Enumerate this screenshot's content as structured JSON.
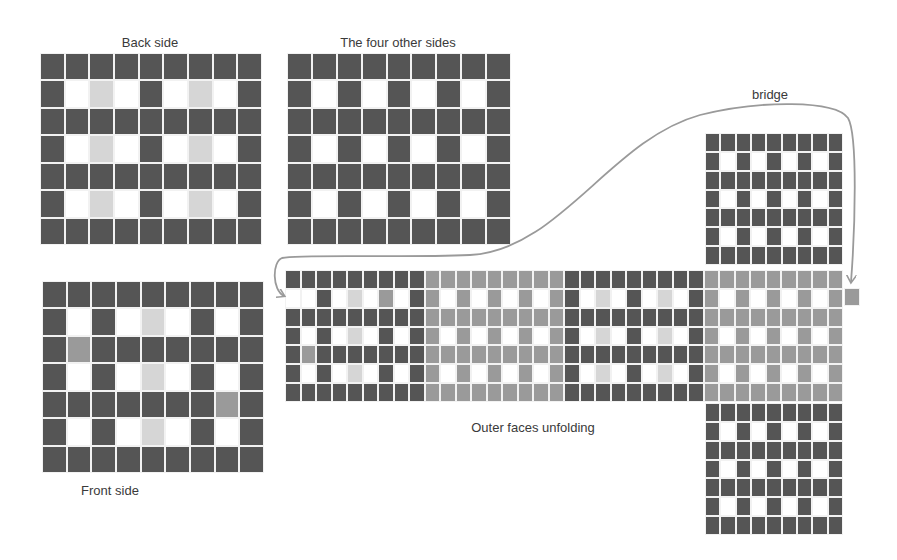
{
  "labels": {
    "back": "Back side",
    "four": "The four other sides",
    "front": "Front side",
    "unfold": "Outer faces unfolding",
    "bridge": "bridge"
  },
  "colors": {
    "dark": "#555555",
    "medium": "#9a9a9a",
    "light": "#d6d6d6",
    "white": "#ffffff",
    "arrow": "#9a9a9a"
  },
  "legend_codes": {
    "D": "dark cell",
    "M": "medium gray cell",
    "L": "light gray cell",
    "W": "white cell"
  },
  "faces": {
    "back_side": {
      "x": 40,
      "y": 53,
      "w": 222,
      "h": 192,
      "cols": 9,
      "rows": 7,
      "cells": [
        "DDDDDDDDD",
        "DWLWDWLWD",
        "DDDDDDDDD",
        "DWLWDWLWD",
        "DDDDDDDDD",
        "DWLWDWLWD",
        "DDDDDDDDD"
      ]
    },
    "four_other_sides": {
      "x": 287,
      "y": 53,
      "w": 224,
      "h": 192,
      "cols": 9,
      "rows": 7,
      "cells": [
        "DDDDDDDDD",
        "DWDWDWDWD",
        "DDDDDDDDD",
        "DWDWDWDWD",
        "DDDDDDDDD",
        "DWDWDWDWD",
        "DDDDDDDDD"
      ]
    },
    "front_side": {
      "x": 42,
      "y": 281,
      "w": 222,
      "h": 192,
      "cols": 9,
      "rows": 7,
      "cells": [
        "DDDDDDDDD",
        "DWDWLWDWD",
        "DMDDDDDDD",
        "DWDWLWDWD",
        "DDDDDDDMD",
        "DWDWLWDWD",
        "DDDDDDDDD"
      ]
    },
    "unfold_strip": {
      "x": 285,
      "y": 270,
      "w": 558,
      "h": 132,
      "cols": 36,
      "rows": 7,
      "cells": [
        "DDDDDDDDDMMMMMMMMMDDDDDDDDDMMMMMMMMM",
        "WWDWLWMWDMWMWMWMWMDWLWDWLWDMWMWMWMWM",
        "DDDDDDDDDMMMMMMMMMDDDDDDDDDMMMMMMMMM",
        "DWDWLWDWDMWMWMWMWMDWLWDWLWDMWMWMWMWM",
        "DMDDDDDDDMMMMMMMMMDDDDDDDDDMMMMMMMMM",
        "DWDWLWDWDMWMWMWMWMDWLWDWLWDMWMWMWMWM",
        "DDDDDDDDDMMMMMMMMMDDDDDDDDDMMMMMMMMM"
      ]
    },
    "top_face": {
      "x": 705,
      "y": 133,
      "w": 138,
      "h": 132,
      "cols": 9,
      "rows": 7,
      "cells": [
        "DDDDDDDDD",
        "DWDWDWDWD",
        "DDDDDDDDD",
        "DWDWDWDWD",
        "DDDDDDDDD",
        "DWDWDWDWD",
        "DDDDDDDDD"
      ]
    },
    "bottom_face": {
      "x": 705,
      "y": 403,
      "w": 138,
      "h": 132,
      "cols": 9,
      "rows": 7,
      "cells": [
        "DDDDDDDDD",
        "DWDWDWDWD",
        "DDDDDDDDD",
        "DWDWDWDWD",
        "DDDDDDDDD",
        "DWDWDWDWD",
        "DDDDDDDDD"
      ]
    },
    "bridge_cell": {
      "x": 844,
      "y": 288,
      "w": 16,
      "h": 18,
      "cols": 1,
      "rows": 1,
      "cells": [
        "M"
      ]
    }
  },
  "label_positions": {
    "back": {
      "x": 150,
      "y": 35
    },
    "four": {
      "x": 398,
      "y": 35
    },
    "front": {
      "x": 110,
      "y": 483
    },
    "unfold": {
      "x": 533,
      "y": 420
    },
    "bridge": {
      "x": 770,
      "y": 87
    }
  },
  "bridge_path": "M 851 282 C 855 230, 858 135, 848 118 C 835 100, 760 100, 700 115 C 610 140, 560 250, 470 255 C 400 258, 300 254, 282 258 C 272 262, 272 290, 284 296"
}
